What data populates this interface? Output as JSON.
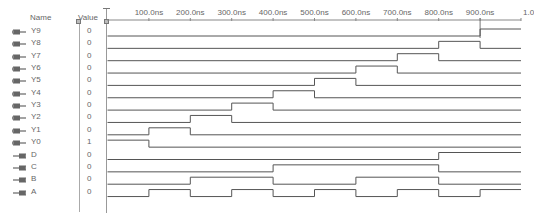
{
  "header": {
    "name_label": "Name",
    "value_label": "Value"
  },
  "ruler": {
    "unit": "ns",
    "ticks": [
      "100.0ns",
      "200.0ns",
      "300.0ns",
      "400.0ns",
      "500.0ns",
      "600.0ns",
      "700.0ns",
      "800.0ns",
      "900.0ns",
      "1.0"
    ],
    "tick_times": [
      100,
      200,
      300,
      400,
      500,
      600,
      700,
      800,
      900,
      1000
    ],
    "cursor_time": 900
  },
  "signals": [
    {
      "name": "Y9",
      "value": "0",
      "direction": "output",
      "transitions": [
        [
          0,
          0
        ],
        [
          900,
          1
        ]
      ]
    },
    {
      "name": "Y8",
      "value": "0",
      "direction": "output",
      "transitions": [
        [
          0,
          0
        ],
        [
          800,
          1
        ],
        [
          900,
          0
        ]
      ]
    },
    {
      "name": "Y7",
      "value": "0",
      "direction": "output",
      "transitions": [
        [
          0,
          0
        ],
        [
          700,
          1
        ],
        [
          800,
          0
        ]
      ]
    },
    {
      "name": "Y6",
      "value": "0",
      "direction": "output",
      "transitions": [
        [
          0,
          0
        ],
        [
          600,
          1
        ],
        [
          700,
          0
        ]
      ]
    },
    {
      "name": "Y5",
      "value": "0",
      "direction": "output",
      "transitions": [
        [
          0,
          0
        ],
        [
          500,
          1
        ],
        [
          600,
          0
        ]
      ]
    },
    {
      "name": "Y4",
      "value": "0",
      "direction": "output",
      "transitions": [
        [
          0,
          0
        ],
        [
          400,
          1
        ],
        [
          500,
          0
        ]
      ]
    },
    {
      "name": "Y3",
      "value": "0",
      "direction": "output",
      "transitions": [
        [
          0,
          0
        ],
        [
          300,
          1
        ],
        [
          400,
          0
        ]
      ]
    },
    {
      "name": "Y2",
      "value": "0",
      "direction": "output",
      "transitions": [
        [
          0,
          0
        ],
        [
          200,
          1
        ],
        [
          300,
          0
        ]
      ]
    },
    {
      "name": "Y1",
      "value": "0",
      "direction": "output",
      "transitions": [
        [
          0,
          0
        ],
        [
          100,
          1
        ],
        [
          200,
          0
        ]
      ]
    },
    {
      "name": "Y0",
      "value": "1",
      "direction": "output",
      "transitions": [
        [
          0,
          1
        ],
        [
          100,
          0
        ]
      ]
    },
    {
      "name": "D",
      "value": "0",
      "direction": "input",
      "transitions": [
        [
          0,
          0
        ],
        [
          800,
          1
        ]
      ]
    },
    {
      "name": "C",
      "value": "0",
      "direction": "input",
      "transitions": [
        [
          0,
          0
        ],
        [
          400,
          1
        ],
        [
          800,
          0
        ]
      ]
    },
    {
      "name": "B",
      "value": "0",
      "direction": "input",
      "transitions": [
        [
          0,
          0
        ],
        [
          200,
          1
        ],
        [
          400,
          0
        ],
        [
          600,
          1
        ],
        [
          800,
          0
        ]
      ]
    },
    {
      "name": "A",
      "value": "0",
      "direction": "input",
      "transitions": [
        [
          0,
          0
        ],
        [
          100,
          1
        ],
        [
          200,
          0
        ],
        [
          300,
          1
        ],
        [
          400,
          0
        ],
        [
          500,
          1
        ],
        [
          600,
          0
        ],
        [
          700,
          1
        ],
        [
          800,
          0
        ],
        [
          900,
          1
        ]
      ]
    }
  ],
  "colors": {
    "wave": "#555555",
    "grid": "#aaaaaa",
    "text": "#666666",
    "pin_icon": "#555555"
  }
}
